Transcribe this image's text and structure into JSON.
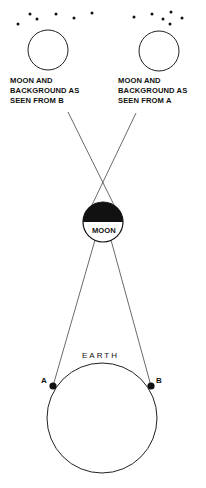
{
  "diagram": {
    "left_label": "MOON AND\nBACKGROUND AS\nSEEN FROM B",
    "right_label": "MOON AND\nBACKGROUND AS\nSEEN FROM A",
    "moon_label": "MOON",
    "earth_label": "EARTH",
    "point_a": "A",
    "point_b": "B"
  }
}
